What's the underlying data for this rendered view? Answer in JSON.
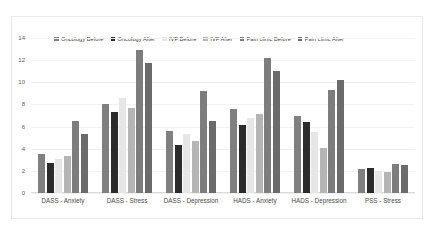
{
  "chart_data": {
    "type": "bar",
    "title": "",
    "xlabel": "",
    "ylabel": "",
    "ylim": [
      0,
      14
    ],
    "yticks": [
      0,
      2,
      4,
      6,
      8,
      10,
      12,
      14
    ],
    "grid": true,
    "legend_position": "top",
    "categories": [
      "DASS - Anxiety",
      "DASS - Stress",
      "DASS - Depression",
      "HADS - Anxiety",
      "HADS - Depression",
      "PSS - Stress"
    ],
    "series": [
      {
        "name": "Oncology Before",
        "color": "#808080",
        "values": [
          3.5,
          8.0,
          5.6,
          7.6,
          7.0,
          2.2
        ]
      },
      {
        "name": "Oncology After",
        "color": "#2b2b2b",
        "values": [
          2.7,
          7.3,
          4.3,
          6.1,
          6.4,
          2.3
        ]
      },
      {
        "name": "IVF Before",
        "color": "#e6e6e6",
        "values": [
          3.1,
          8.6,
          5.3,
          6.8,
          5.5,
          2.0
        ]
      },
      {
        "name": "IVF After",
        "color": "#b5b5b5",
        "values": [
          3.3,
          7.7,
          4.7,
          7.1,
          4.1,
          1.9
        ]
      },
      {
        "name": "Pain clinic Before",
        "color": "#7d7d7d",
        "values": [
          6.5,
          12.9,
          9.2,
          12.2,
          9.3,
          2.6
        ]
      },
      {
        "name": "Pain clinic After",
        "color": "#6b6b6b",
        "values": [
          5.3,
          11.7,
          6.5,
          11.0,
          10.2,
          2.5
        ]
      }
    ]
  },
  "axis": {
    "y_tick_labels": [
      "14",
      "12",
      "10",
      "8",
      "6",
      "4",
      "2",
      "0"
    ]
  },
  "legend": {
    "items": [
      {
        "label": "Oncology Before",
        "color": "#808080"
      },
      {
        "label": "Oncology After",
        "color": "#2b2b2b"
      },
      {
        "label": "IVF Before",
        "color": "#e6e6e6"
      },
      {
        "label": "IVF After",
        "color": "#b5b5b5"
      },
      {
        "label": "Pain clinic Before",
        "color": "#7d7d7d"
      },
      {
        "label": "Pain clinic After",
        "color": "#6b6b6b"
      }
    ]
  }
}
